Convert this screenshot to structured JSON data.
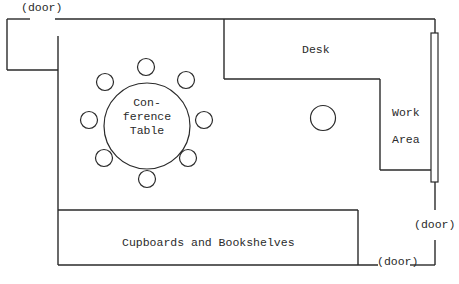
{
  "diagram": {
    "type": "floor-plan",
    "colors": {
      "line": "#2a2a2a",
      "background": "#ffffff"
    },
    "labels": {
      "door_top_left": "(door)",
      "door_right": "(door)",
      "door_bottom": "(door)",
      "desk": "Desk",
      "work_area_line1": "Work",
      "work_area_line2": "Area",
      "table_line1": "Con-",
      "table_line2": "ference",
      "table_line3": "Table",
      "cupboards": "Cupboards and Bookshelves"
    },
    "furniture": {
      "conference_table": {
        "chairs": 8
      },
      "round_object": 1
    }
  }
}
